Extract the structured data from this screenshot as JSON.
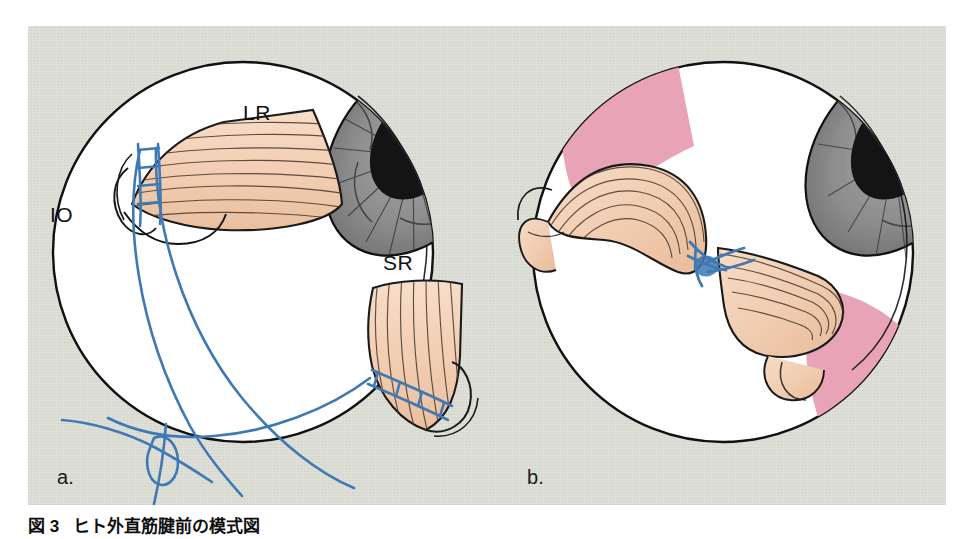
{
  "figure": {
    "caption_number": "図 3",
    "caption_text": "ヒト外直筋腱前の模式図",
    "panels": [
      {
        "id": "a",
        "letter": "a.",
        "description": "Right eye globe seen from anterior-oblique view with lateral rectus and superior rectus muscles disinserted and blue sutures placed; curved needle with suture outside the globe.",
        "labels": [
          {
            "name": "LR",
            "meaning": "lateral rectus"
          },
          {
            "name": "SR",
            "meaning": "superior rectus"
          },
          {
            "name": "IO",
            "meaning": "inferior oblique"
          }
        ]
      },
      {
        "id": "b",
        "letter": "b.",
        "description": "Same globe after muscle transposition; the two muscle bellies are re-routed and joined by a blue suture knot, leaving pink bare sclera exposed superiorly and inferotemporally.",
        "labels": []
      }
    ],
    "colors": {
      "panel_background": "#dfe0d8",
      "page_background": "#ffffff",
      "globe_fill": "#ffffff",
      "outline": "#111111",
      "muscle_fill": "#f2cdb1",
      "muscle_striation": "#4a3a2e",
      "iris_fill": "#8f8f8f",
      "pupil_fill": "#141414",
      "suture_blue": "#3f79b4",
      "bare_sclera_pink": "#e8a3b6",
      "caption_text": "#0d0d0d"
    }
  }
}
